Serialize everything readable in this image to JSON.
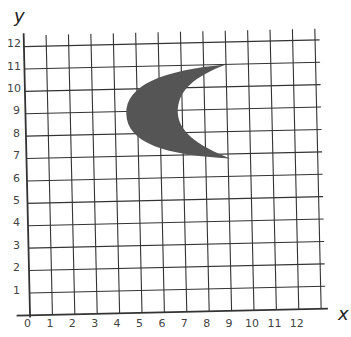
{
  "diagram": {
    "type": "coordinate-grid",
    "x_axis": {
      "label": "x",
      "ticks": [
        "0",
        "1",
        "2",
        "3",
        "4",
        "5",
        "6",
        "7",
        "8",
        "9",
        "10",
        "11",
        "12"
      ]
    },
    "y_axis": {
      "label": "y",
      "ticks": [
        "1",
        "2",
        "3",
        "4",
        "5",
        "6",
        "7",
        "8",
        "9",
        "10",
        "11",
        "12"
      ]
    },
    "shape": {
      "kind": "crescent",
      "fill": "#555555",
      "upper_tip": [
        9.0,
        11.0
      ],
      "lower_tip": [
        9.1,
        6.8
      ],
      "outer_leftmost": [
        4.5,
        8.9
      ],
      "inner_leftmost": [
        6.8,
        8.9
      ]
    },
    "colors": {
      "grid": "#333333",
      "background": "#ffffff",
      "shape": "#555555"
    }
  }
}
